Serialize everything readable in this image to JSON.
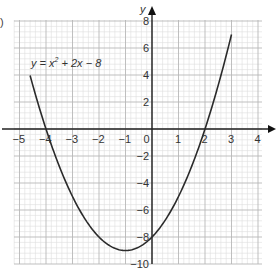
{
  "part_label": ")",
  "chart_data": {
    "type": "line",
    "title": "",
    "equation": {
      "lhs": "y",
      "text_pre": "y = x",
      "exp": "2",
      "text_post": " + 2x − 8"
    },
    "xlabel": "",
    "ylabel": "y",
    "xlim": [
      -5,
      4
    ],
    "ylim": [
      -10,
      8
    ],
    "x_ticks": [
      -5,
      -4,
      -3,
      -2,
      -1,
      0,
      1,
      2,
      3,
      4
    ],
    "x_tick_labels": [
      "−5",
      "−4",
      "−3",
      "−2",
      "−1",
      "0",
      "1",
      "2",
      "3",
      "4"
    ],
    "y_ticks": [
      -10,
      -8,
      -6,
      -4,
      -2,
      2,
      4,
      6,
      8
    ],
    "y_tick_labels": [
      "−10",
      "−8",
      "−6",
      "−4",
      "−2",
      "2",
      "4",
      "6",
      "8"
    ],
    "grid": true,
    "series": [
      {
        "name": "y = x^2 + 2x - 8",
        "x": [
          -4.5,
          -4,
          -3.5,
          -3,
          -2.5,
          -2,
          -1.5,
          -1,
          -0.5,
          0,
          0.5,
          1,
          1.5,
          2,
          2.5,
          3
        ],
        "values": [
          3.25,
          0,
          -2.75,
          -5,
          -6.75,
          -8,
          -8.75,
          -9,
          -8.75,
          -8,
          -6.75,
          -5,
          -2.75,
          0,
          3.25,
          7
        ]
      }
    ]
  }
}
